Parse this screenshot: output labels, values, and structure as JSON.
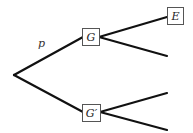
{
  "diagram": {
    "type": "probability-tree",
    "root": {
      "id": "root"
    },
    "nodes": [
      {
        "id": "G",
        "label": "G"
      },
      {
        "id": "G_prime",
        "label": "G′"
      },
      {
        "id": "E",
        "label": "E"
      }
    ],
    "edge_labels": {
      "root_to_G": "p"
    },
    "edges": [
      {
        "from": "root",
        "to": "G",
        "label": "p"
      },
      {
        "from": "root",
        "to": "G_prime",
        "label": ""
      },
      {
        "from": "G",
        "to": "E",
        "label": ""
      },
      {
        "from": "G",
        "to": "G_leaf_2",
        "label": ""
      },
      {
        "from": "G_prime",
        "to": "G_prime_leaf_1",
        "label": ""
      },
      {
        "from": "G_prime",
        "to": "G_prime_leaf_2",
        "label": ""
      }
    ]
  }
}
